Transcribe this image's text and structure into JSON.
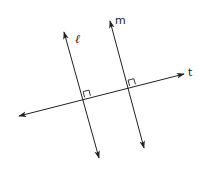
{
  "diagram": {
    "type": "geometry",
    "colors": {
      "line": "#222222",
      "background": "#ffffff"
    },
    "lines": [
      {
        "id": "l",
        "label": "ℓ",
        "x1": 99,
        "y1": 158,
        "x2": 64,
        "y2": 32,
        "arrows": "both"
      },
      {
        "id": "m",
        "label": "m",
        "x1": 144,
        "y1": 148,
        "x2": 110,
        "y2": 21,
        "arrows": "both"
      },
      {
        "id": "t",
        "label": "t",
        "x1": 19,
        "y1": 116,
        "x2": 184,
        "y2": 74,
        "arrows": "both"
      }
    ],
    "right_angles": [
      {
        "at": "l∩t",
        "x": 83,
        "y": 97
      },
      {
        "at": "m∩t",
        "x": 128,
        "y": 86
      }
    ],
    "labels": {
      "l": "ℓ",
      "m": "m",
      "t": "t"
    }
  }
}
